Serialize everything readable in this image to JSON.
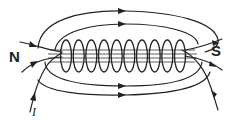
{
  "diagram": {
    "labels": {
      "north_pole": "N",
      "south_pole": "S",
      "current": "I"
    },
    "coil_turns": 10,
    "field_direction": "inside coil from N-side to S-side; outer loops arrows pointing right on top and bottom",
    "colors": {
      "ink": "#222222",
      "background": "#ffffff"
    }
  }
}
